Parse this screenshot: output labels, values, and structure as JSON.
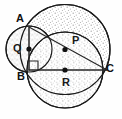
{
  "figure": {
    "background_color": "#fefefe",
    "stroke_color": "#1a1a1a",
    "fill_pattern": "stippled-dots",
    "fill_dot_color": "#9a9a9a",
    "labels": {
      "A": "A",
      "B": "B",
      "C": "C",
      "P": "P",
      "Q": "Q",
      "R": "R"
    },
    "circles": [
      {
        "name": "circle-P",
        "center_label": "P",
        "cx": 65,
        "cy": 49.5,
        "r": 45,
        "shaded": true
      },
      {
        "name": "circle-Q",
        "center_label": "Q",
        "cx": 29,
        "cy": 49,
        "r": 23,
        "shaded": true
      },
      {
        "name": "circle-R",
        "center_label": "R",
        "cx": 65,
        "cy": 70,
        "r": 38,
        "shaded": true
      }
    ],
    "points": [
      {
        "name": "A",
        "x": 29,
        "y": 27,
        "marked": false
      },
      {
        "name": "B",
        "x": 29,
        "y": 70,
        "marked": false
      },
      {
        "name": "C",
        "x": 107,
        "y": 70,
        "marked": false
      },
      {
        "name": "P",
        "x": 65,
        "y": 49.5,
        "marked": true
      },
      {
        "name": "Q",
        "x": 29,
        "y": 49,
        "marked": true
      },
      {
        "name": "R",
        "x": 65,
        "y": 70,
        "marked": true
      }
    ],
    "segments": [
      {
        "name": "segment-AB",
        "from": "A",
        "to": "B"
      },
      {
        "name": "segment-BC",
        "from": "B",
        "to": "C"
      },
      {
        "name": "segment-AC",
        "from": "A",
        "to": "C"
      }
    ],
    "right_angle": {
      "at": "B",
      "size": 9,
      "marker": "square"
    }
  }
}
